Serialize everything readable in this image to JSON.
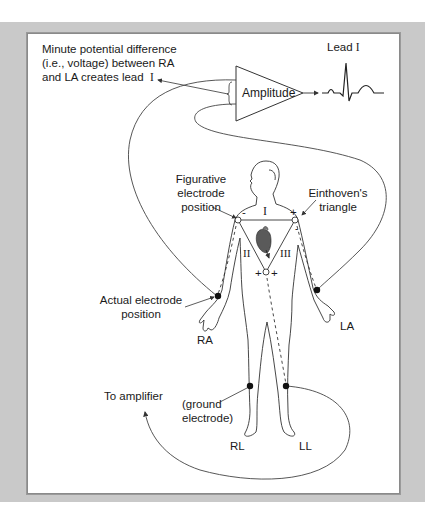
{
  "figure": {
    "colors": {
      "frame": "#c9c9c9",
      "panel": "#ffffff",
      "line": "#333333",
      "heart": "#555555"
    }
  },
  "labels": {
    "potential_line1": "Minute potential difference",
    "potential_line2": "(i.e., voltage) between RA",
    "potential_line3": "and LA creates lead",
    "potential_lead_numeral": "I",
    "amplitude": "Amplitude",
    "lead_output": "Lead",
    "lead_output_numeral": "I",
    "figurative_line1": "Figurative",
    "figurative_line2": "electrode",
    "figurative_line3": "position",
    "einthoven_line1": "Einthoven's",
    "einthoven_line2": "triangle",
    "actual_line1": "Actual electrode",
    "actual_line2": "position",
    "ra": "RA",
    "la": "LA",
    "rl": "RL",
    "ll": "LL",
    "to_amplifier": "To amplifier",
    "ground_line1": "(ground",
    "ground_line2": "electrode)"
  },
  "triangle": {
    "side_top": "I",
    "side_left": "II",
    "side_right": "III",
    "sign_left_top": "-",
    "sign_right_top": "+",
    "sign_right_minus": "-",
    "sign_bottom_left": "+",
    "sign_bottom_right": "+"
  }
}
